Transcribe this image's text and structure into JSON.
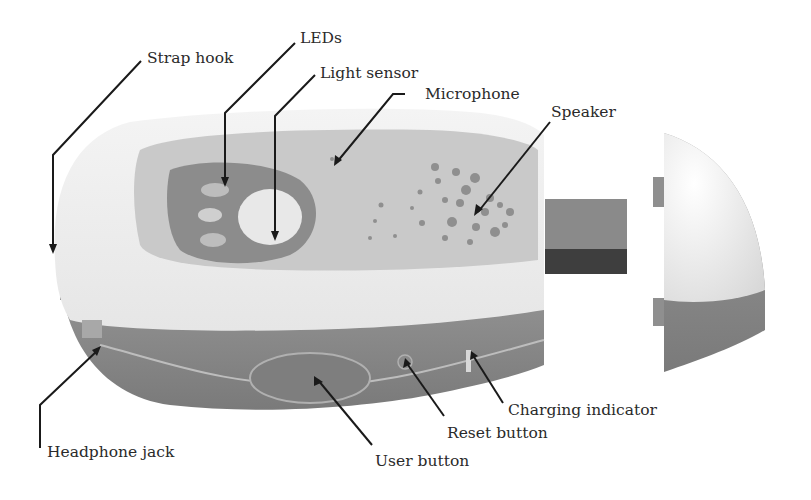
{
  "diagram": {
    "type": "labeled product illustration",
    "labels": {
      "strap_hook": "Strap hook",
      "leds": "LEDs",
      "light_sensor": "Light sensor",
      "microphone": "Microphone",
      "speaker": "Speaker",
      "headphone_jack": "Headphone jack",
      "user_button": "User button",
      "reset_button": "Reset button",
      "charging_indicator": "Charging indicator"
    },
    "colors": {
      "body_top": "#f2f2f2",
      "body_side": "#8c8c8c",
      "panel": "#c8c8c8",
      "led_bezel": "#8a8a8a",
      "connector": "#7e7e7e",
      "leader_line": "#1a1a1a"
    }
  }
}
